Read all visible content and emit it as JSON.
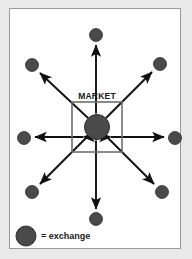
{
  "figure": {
    "title": "MARKET",
    "background_color": "#e9e9e9",
    "panel_color": "#ffffff",
    "panel_border_color": "#9a9a9a"
  },
  "colors": {
    "node_fill": "#4a4a4a",
    "node_stroke": "#2e2e2e",
    "arrow": "#111111",
    "box_border": "#6e6e6e",
    "text": "#1a1a1a"
  },
  "market_box": {
    "label": "MARKET",
    "x": 72,
    "y": 102,
    "width": 50,
    "height": 50
  },
  "hub": {
    "name": "market-hub",
    "cx": 97,
    "cy": 127,
    "r": 12.5
  },
  "nodes": [
    {
      "id": "exchange-n",
      "label": "exchange",
      "cx": 96,
      "cy": 35,
      "r": 6.5
    },
    {
      "id": "exchange-ne",
      "label": "exchange",
      "cx": 160,
      "cy": 64,
      "r": 6.5
    },
    {
      "id": "exchange-e",
      "label": "exchange",
      "cx": 175,
      "cy": 138,
      "r": 6.5
    },
    {
      "id": "exchange-se",
      "label": "exchange",
      "cx": 162,
      "cy": 192,
      "r": 6.5
    },
    {
      "id": "exchange-s",
      "label": "exchange",
      "cx": 96,
      "cy": 219,
      "r": 6.5
    },
    {
      "id": "exchange-sw",
      "label": "exchange",
      "cx": 32,
      "cy": 192,
      "r": 6.5
    },
    {
      "id": "exchange-w",
      "label": "exchange",
      "cx": 24,
      "cy": 138,
      "r": 6.5
    },
    {
      "id": "exchange-nw",
      "label": "exchange",
      "cx": 32,
      "cy": 65,
      "r": 6.5
    }
  ],
  "connections": {
    "style": "double-headed-arrow",
    "count": 8,
    "description": "bidirectional flow between market hub and each exchange"
  },
  "legend": {
    "symbol": "filled-circle",
    "text": "= exchange",
    "cx": 26,
    "cy": 236,
    "r": 10
  }
}
